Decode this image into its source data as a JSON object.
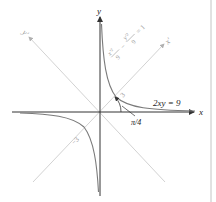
{
  "figure": {
    "type": "rotated-hyperbola-diagram",
    "axes": {
      "x_label": "x",
      "y_label": "y",
      "x_prime_label": "x'",
      "y_prime_label": "y'"
    },
    "curve_equation": "2xy = 9",
    "rotated_equation": {
      "term1_num": "x'²",
      "term1_den": "9",
      "minus": "−",
      "term2_num": "y'²",
      "term2_den": "9",
      "equals": "= 1"
    },
    "angle_label": "π/4",
    "vertex_label_positive": "3",
    "vertex_label_negative": "−3",
    "colors": {
      "axis": "#333333",
      "rotated_axis": "#b8b8b8",
      "curve": "#7a7a7a",
      "border_line": "#bdbdbd"
    }
  }
}
